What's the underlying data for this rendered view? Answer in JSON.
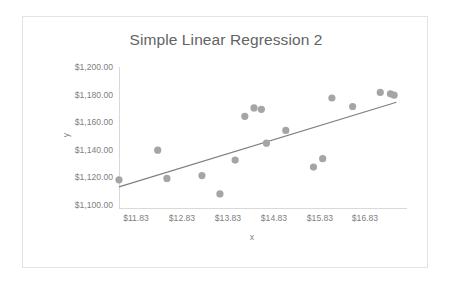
{
  "chart_data": {
    "type": "scatter",
    "title": "Simple Linear Regression 2",
    "xlabel": "x",
    "ylabel": "y",
    "xlim": [
      11.83,
      18.08
    ],
    "ylim": [
      1100,
      1200
    ],
    "grid": false,
    "legend": "none",
    "x_tick_labels": [
      "$11.83",
      "$12.83",
      "$13.83",
      "$14.83",
      "$15.83",
      "$16.83"
    ],
    "x_tick_values": [
      11.83,
      12.83,
      13.83,
      14.83,
      15.83,
      16.83
    ],
    "y_tick_labels": [
      "$1,100.00",
      "$1,120.00",
      "$1,140.00",
      "$1,160.00",
      "$1,180.00",
      "$1,200.00"
    ],
    "y_tick_values": [
      1100,
      1120,
      1140,
      1160,
      1180,
      1200
    ],
    "series": [
      {
        "name": "y",
        "marker": "circle",
        "color": "#a5a5a5",
        "points": [
          [
            11.83,
            1120
          ],
          [
            12.67,
            1141
          ],
          [
            12.87,
            1121
          ],
          [
            13.63,
            1123
          ],
          [
            14.02,
            1110
          ],
          [
            14.35,
            1134
          ],
          [
            14.56,
            1165
          ],
          [
            14.76,
            1171
          ],
          [
            14.92,
            1170
          ],
          [
            15.03,
            1146
          ],
          [
            15.45,
            1155
          ],
          [
            16.05,
            1129
          ],
          [
            16.25,
            1135
          ],
          [
            16.45,
            1178
          ],
          [
            16.9,
            1172
          ],
          [
            17.5,
            1182
          ],
          [
            17.72,
            1181
          ],
          [
            17.8,
            1180
          ]
        ]
      }
    ],
    "trendline": {
      "name": "Linear trendline",
      "color": "#808080",
      "x_start": 11.83,
      "y_start": 1115,
      "x_end": 17.85,
      "y_end": 1175
    }
  },
  "axes": {
    "x_title": "x",
    "y_title": "y"
  }
}
